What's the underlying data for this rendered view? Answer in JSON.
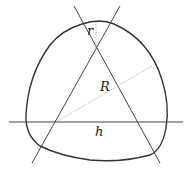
{
  "diagram": {
    "labels": {
      "r": "r",
      "R": "R",
      "h": "h"
    },
    "colors": {
      "stroke": "#333333",
      "dotted": "#999999",
      "background": "#ffffff"
    }
  }
}
